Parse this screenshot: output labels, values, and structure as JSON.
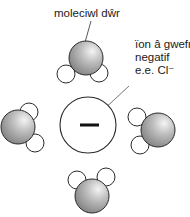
{
  "diagram": {
    "labels": {
      "water_molecule": "moleciwl dŵr",
      "ion_line1": "ïon â gwefr",
      "ion_line2": "negatif",
      "ion_line3": "e.e. Cl⁻"
    },
    "ion": {
      "charge_symbol": "−",
      "cx": 88,
      "cy": 125,
      "r": 28
    },
    "molecules": [
      {
        "name": "top",
        "o": [
          86,
          60
        ],
        "h": [
          [
            66,
            74
          ],
          [
            99,
            73
          ]
        ]
      },
      {
        "name": "left",
        "o": [
          18,
          127
        ],
        "h": [
          [
            29,
            112
          ],
          [
            35,
            143
          ]
        ]
      },
      {
        "name": "right",
        "o": [
          158,
          130
        ],
        "h": [
          [
            137,
            117
          ],
          [
            140,
            145
          ]
        ]
      },
      {
        "name": "bottom",
        "o": [
          92,
          197
        ],
        "h": [
          [
            77,
            180
          ],
          [
            106,
            177
          ]
        ]
      }
    ],
    "colors": {
      "stroke": "#2a2a2a",
      "oxygen_light": "#ebebeb",
      "oxygen_dark": "#8a8a8a",
      "hydrogen": "#ffffff",
      "leader": "#555555"
    }
  }
}
